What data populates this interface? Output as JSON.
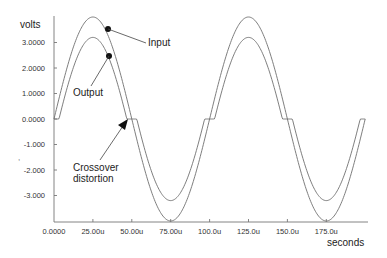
{
  "chart_data": {
    "type": "line",
    "title": "",
    "xlabel": "seconds",
    "ylabel": "volts",
    "x_ticks": [
      "0.0000",
      "25.00u",
      "50.00u",
      "75.00u",
      "100.0u",
      "125.0u",
      "150.0u",
      "175.0u"
    ],
    "y_ticks": [
      "3.0000",
      "2.0000",
      "1.0000",
      "0.0000",
      "-1.000",
      "-2.000",
      "-3.000"
    ],
    "y_tick_values": [
      3,
      2,
      1,
      0,
      -1,
      -2,
      -3
    ],
    "x_tick_values_us": [
      0,
      25,
      50,
      75,
      100,
      125,
      150,
      175
    ],
    "xlim_us": [
      0,
      200
    ],
    "ylim": [
      -4,
      4.2
    ],
    "grid": false,
    "series": [
      {
        "name": "Input",
        "description": "sine wave, amplitude 4.0 V, period 100u",
        "amplitude": 4.0,
        "period_us": 100
      },
      {
        "name": "Output",
        "description": "sine with crossover dead zone of ±0.8 V (peak ≈3.2 V)",
        "amplitude": 4.0,
        "dead_zone": 0.8,
        "period_us": 100
      }
    ],
    "annotations": [
      {
        "text": "Input",
        "points_to": "Input curve near 35u, 3.5V"
      },
      {
        "text": "Output",
        "points_to": "Output curve near 35u, 2.4V"
      },
      {
        "text": "Crossover distortion",
        "points_to": "flat region near 50u, 0V"
      }
    ]
  },
  "labels": {
    "ylabel": "volts",
    "xlabel": "seconds",
    "input": "Input",
    "output": "Output",
    "crossover_line1": "Crossover",
    "crossover_line2": "distortion"
  }
}
